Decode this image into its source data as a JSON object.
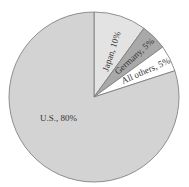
{
  "chart_data": {
    "type": "pie",
    "title": "",
    "start_angle_deg": 0,
    "direction": "clockwise",
    "slices": [
      {
        "label": "Japan",
        "value": 10,
        "text": "Japan, 10%",
        "color": "#e3e3e3"
      },
      {
        "label": "Germany",
        "value": 5,
        "text": "Germany, 5%",
        "color": "#a9a9a9"
      },
      {
        "label": "All others",
        "value": 5,
        "text": "All others, 5%",
        "color": "#ffffff"
      },
      {
        "label": "U.S.",
        "value": 80,
        "text": "U.S., 80%",
        "color": "#d3d3d3"
      }
    ],
    "categories": [
      "Japan",
      "Germany",
      "All others",
      "U.S."
    ],
    "values": [
      10,
      5,
      5,
      80
    ],
    "units": "%",
    "legend": "none (labels inside slices)"
  },
  "labels": {
    "japan": "Japan, 10%",
    "germany": "Germany, 5%",
    "others": "All others, 5%",
    "us": "U.S., 80%"
  }
}
